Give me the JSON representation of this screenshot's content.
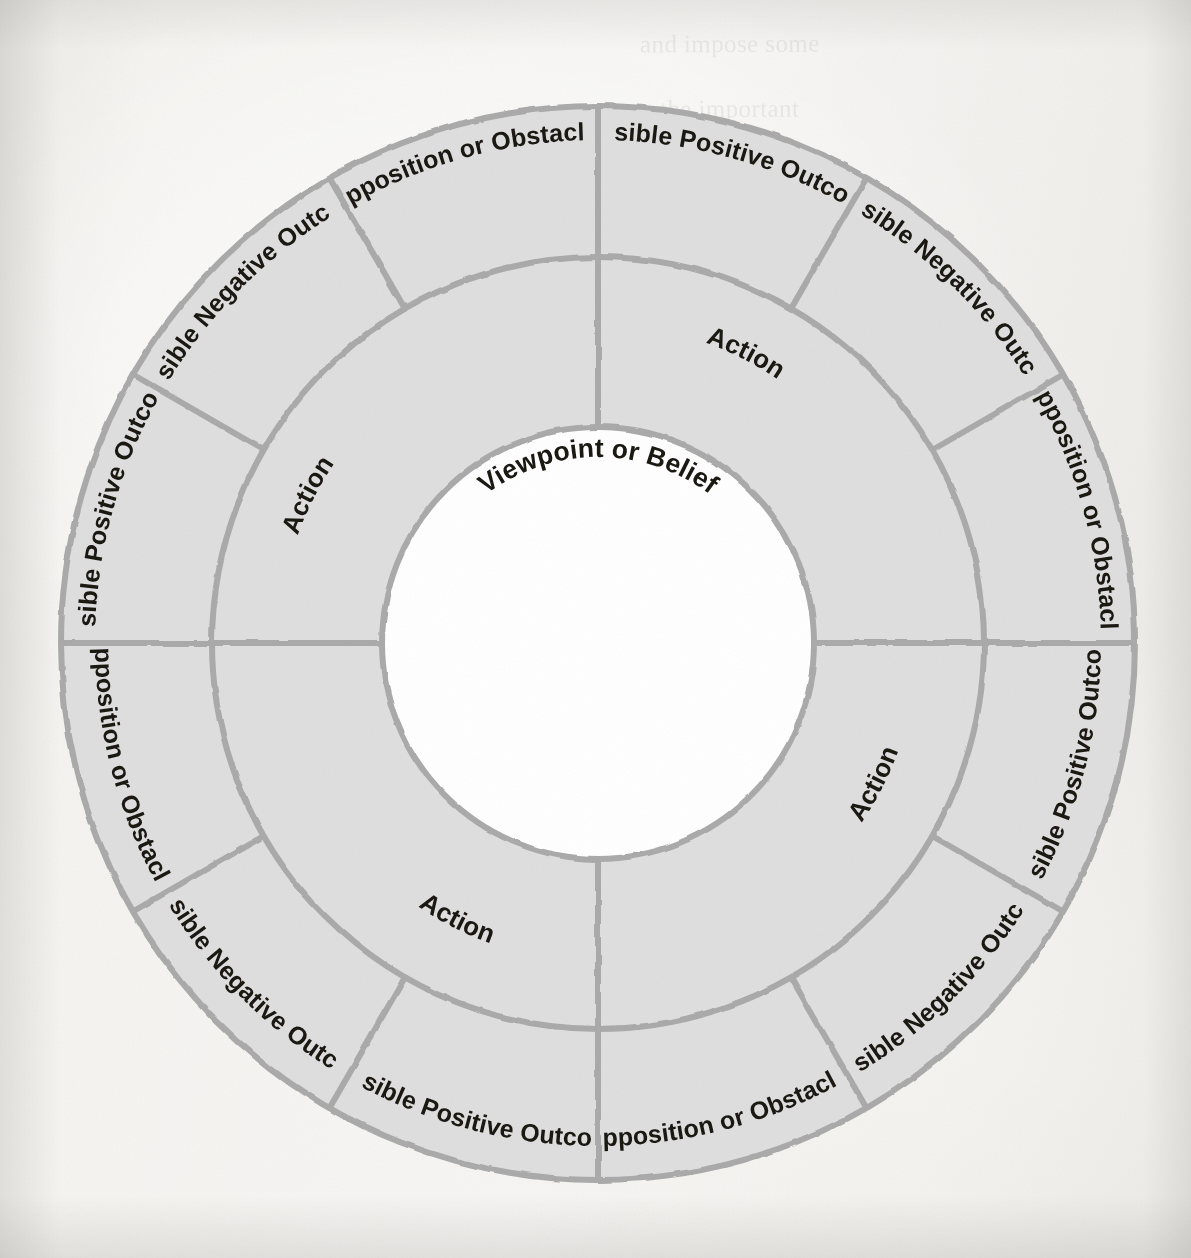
{
  "diagram": {
    "type": "concentric-wheel",
    "center_label": "Viewpoint or Belief",
    "colors": {
      "segment_fill": "#dedede",
      "segment_stroke": "#a9a9a9",
      "hub_fill": "#ffffff",
      "text": "#15120f",
      "paper": "#f4f3f0"
    },
    "geometry": {
      "center_x": 598,
      "center_y": 643,
      "outer_radius": 537,
      "middle_radius": 386,
      "inner_radius": 216,
      "quadrant_count": 4,
      "outer_segments_per_quadrant": 3
    },
    "rings": [
      {
        "name": "center",
        "labels": [
          "Viewpoint or Belief"
        ]
      },
      {
        "name": "middle",
        "labels": [
          "Action",
          "Action",
          "Action",
          "Action"
        ]
      },
      {
        "name": "outer",
        "labels": [
          "Opposition or Obstacles",
          "Possible Negative Outcome",
          "Possible Positive Outcome",
          "Opposition or Obstacles",
          "Possible Negative Outcome",
          "Possible Positive Outcome",
          "Opposition or Obstacles",
          "Possible Negative Outcome",
          "Possible Positive Outcome",
          "Opposition or Obstacles",
          "Possible Negative Outcome",
          "Possible Positive Outcome"
        ]
      }
    ],
    "quadrants": [
      {
        "id": "top-right",
        "action": "Action",
        "outer": [
          {
            "id": "tr-positive",
            "label": "Possible Positive Outcome"
          },
          {
            "id": "tr-negative",
            "label": "Possible Negative Outcome"
          },
          {
            "id": "tr-opposition",
            "label": "Opposition or Obstacles"
          }
        ]
      },
      {
        "id": "bottom-right",
        "action": "Action",
        "outer": [
          {
            "id": "br-positive",
            "label": "Possible Positive Outcome"
          },
          {
            "id": "br-negative",
            "label": "Possible Negative Outcome"
          },
          {
            "id": "br-opposition",
            "label": "Opposition or Obstacles"
          }
        ]
      },
      {
        "id": "bottom-left",
        "action": "Action",
        "outer": [
          {
            "id": "bl-positive",
            "label": "Possible Positive Outcome"
          },
          {
            "id": "bl-negative",
            "label": "Possible Negative Outcome"
          },
          {
            "id": "bl-opposition",
            "label": "Opposition or Obstacles"
          }
        ]
      },
      {
        "id": "top-left",
        "action": "Action",
        "outer": [
          {
            "id": "tl-positive",
            "label": "Possible Positive Outcome"
          },
          {
            "id": "tl-negative",
            "label": "Possible Negative Outcome"
          },
          {
            "id": "tl-opposition",
            "label": "Opposition or Obstacles"
          }
        ]
      }
    ],
    "bleed_through_lines": [
      "and impose some",
      "the important",
      "ideas",
      "meaning of the",
      "well as",
      "at least to de"
    ]
  }
}
